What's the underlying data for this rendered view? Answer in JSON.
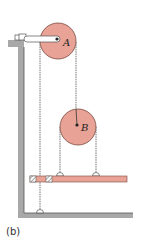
{
  "figure": {
    "caption": "(b)",
    "pulley_a_label": "A",
    "pulley_b_label": "B"
  },
  "colors": {
    "pulley_fill": "#e8a396",
    "pulley_stroke": "#7a4a40",
    "wall_fill": "#a8a8a8",
    "bar_fill": "#e8a396",
    "rope": "#555555",
    "arm_fill": "#ffffff"
  }
}
